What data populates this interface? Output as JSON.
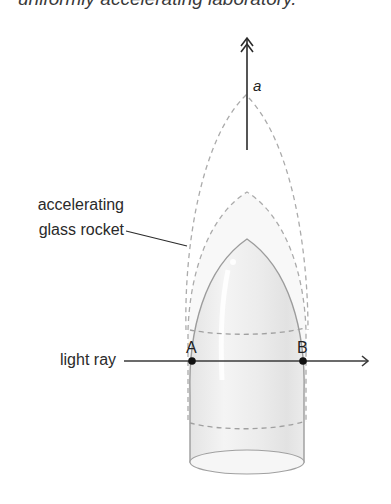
{
  "caption": "uniformly accelerating laboratory.",
  "labels": {
    "acceleration": "a",
    "rocket_line1": "accelerating",
    "rocket_line2": "glass rocket",
    "light_ray": "light ray",
    "point_a": "A",
    "point_b": "B"
  },
  "colors": {
    "line": "#2b2b2b",
    "dashed": "#a8a8a8",
    "rocket_fill": "#ececec",
    "rocket_outline": "#9a9a9a"
  }
}
